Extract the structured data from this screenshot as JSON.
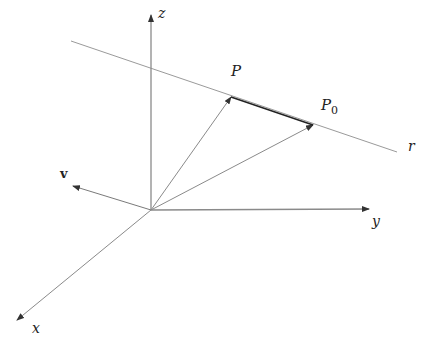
{
  "diagram": {
    "colors": {
      "background": "#ffffff",
      "axis": "#8a8a8a",
      "line": "#9a9a9a",
      "vector": "#7a7a7a",
      "segment": "#222222",
      "label": "#222222"
    },
    "origin": {
      "x": 151,
      "y": 210
    },
    "axes": [
      {
        "name": "x",
        "label": "x",
        "end": {
          "x": 17,
          "y": 320
        },
        "label_pos": {
          "x": 32,
          "y": 333
        }
      },
      {
        "name": "y",
        "label": "y",
        "end": {
          "x": 369,
          "y": 209
        },
        "label_pos": {
          "x": 372,
          "y": 226
        }
      },
      {
        "name": "z",
        "label": "z",
        "end": {
          "x": 151,
          "y": 15
        },
        "label_pos": {
          "x": 158,
          "y": 18
        }
      }
    ],
    "line_r": {
      "label": "r",
      "start": {
        "x": 71,
        "y": 41
      },
      "end": {
        "x": 397,
        "y": 152
      },
      "label_pos": {
        "x": 408,
        "y": 151
      }
    },
    "points": [
      {
        "name": "P",
        "label": "P",
        "sub": "",
        "pos": {
          "x": 231,
          "y": 97
        },
        "label_pos": {
          "x": 231,
          "y": 76
        }
      },
      {
        "name": "P0",
        "label": "P",
        "sub": "0",
        "pos": {
          "x": 313,
          "y": 125
        },
        "label_pos": {
          "x": 321,
          "y": 110
        }
      }
    ],
    "vector_v": {
      "label": "v",
      "end": {
        "x": 73,
        "y": 186
      },
      "label_pos": {
        "x": 60,
        "y": 178
      }
    }
  }
}
